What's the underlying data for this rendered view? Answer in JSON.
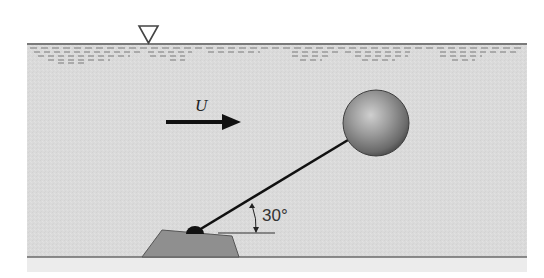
{
  "figure": {
    "type": "fluid-mechanics-diagram",
    "flow_label": "U",
    "angle_label": "30°",
    "angle_degrees": 30,
    "elements": {
      "free_surface_symbol": "inverted-triangle",
      "flow_arrow": "arrow-right",
      "sphere": "buoyant-sphere",
      "rod": "tether-rod",
      "hinge": "pivot",
      "base": "trapezoid-anchor-block",
      "seabed": "bottom-line"
    },
    "colors": {
      "water": "#dcdcdc",
      "below_bed": "#eeeeee",
      "surface_line": "#7a7a7a",
      "surface_dash": "#9a9a9a",
      "base_fill": "#8f8f8f",
      "base_stroke": "#555555",
      "hinge": "#111111",
      "rod": "#111111",
      "arrow": "#111111",
      "sphere_light": "#c8c8c8",
      "sphere_mid": "#909090",
      "sphere_dark": "#555555"
    }
  }
}
